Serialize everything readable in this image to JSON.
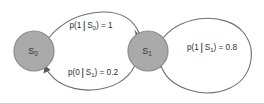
{
  "figure": {
    "type": "state-transition-diagram",
    "background_color": "#ffffff",
    "node_fill_color": "#aaaaaa",
    "node_stroke_color": "#8a8a8a",
    "edge_color": "#6e6e6e",
    "text_color": "#2e2e2e"
  },
  "nodes": [
    {
      "id": "s0",
      "name": "state-node-s0",
      "label_main": "S",
      "label_sub": "0",
      "cx": 34,
      "cy": 51,
      "r": 20
    },
    {
      "id": "s1",
      "name": "state-node-s1",
      "label_main": "S",
      "label_sub": "1",
      "cx": 148,
      "cy": 51,
      "r": 20
    }
  ],
  "edges": [
    {
      "id": "s0-to-s1",
      "name": "transition-s0-to-s1",
      "from": "s0",
      "to": "s1",
      "label_prefix": "p(1",
      "label_bar": "|",
      "label_state": "S",
      "label_state_sub": "0",
      "label_suffix": ") = 1",
      "label_full": "p(1|S0) = 1",
      "label_x": 91,
      "label_y": 26,
      "probability": 1
    },
    {
      "id": "s1-to-s0",
      "name": "transition-s1-to-s0",
      "from": "s1",
      "to": "s0",
      "label_prefix": "p(0",
      "label_bar": "|",
      "label_state": "S",
      "label_state_sub": "1",
      "label_suffix": ") = 0.2",
      "label_full": "p(0|S1) = 0.2",
      "label_x": 93,
      "label_y": 73,
      "probability": 0.2
    },
    {
      "id": "s1-self-loop",
      "name": "transition-s1-self-loop",
      "from": "s1",
      "to": "s1",
      "label_prefix": "p(1",
      "label_bar": "|",
      "label_state": "S",
      "label_state_sub": "1",
      "label_suffix": ") = 0.8",
      "label_full": "p(1|S1) = 0.8",
      "label_x": 212,
      "label_y": 48,
      "probability": 0.8
    }
  ]
}
